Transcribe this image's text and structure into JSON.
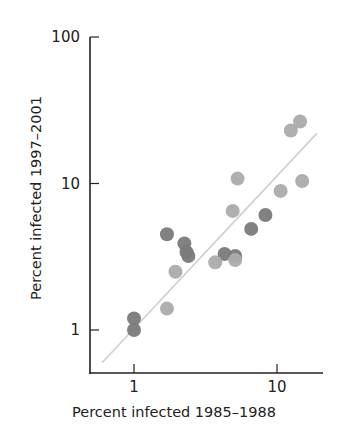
{
  "chart_data": {
    "type": "scatter",
    "title": "",
    "xlabel": "Percent infected 1985–1988",
    "ylabel": "Percent infected 1997–2001",
    "xscale": "log",
    "yscale": "log",
    "xlim": [
      0.55,
      22
    ],
    "ylim": [
      0.55,
      100
    ],
    "xticks": [
      {
        "value": 1,
        "label": "1"
      },
      {
        "value": 10,
        "label": "10"
      }
    ],
    "yticks": [
      {
        "value": 1,
        "label": "1"
      },
      {
        "value": 10,
        "label": "10"
      },
      {
        "value": 100,
        "label": "100"
      }
    ],
    "grid": false,
    "legend": null,
    "colors": {
      "dark": "#7a7a7a",
      "light": "#ababab",
      "trend": "#cfcfcf",
      "axis": "#222222"
    },
    "series": [
      {
        "name": "dark points",
        "color": "#7a7a7a",
        "points": [
          {
            "x": 1.0,
            "y": 1.0
          },
          {
            "x": 1.0,
            "y": 1.2
          },
          {
            "x": 1.7,
            "y": 4.5
          },
          {
            "x": 2.25,
            "y": 3.9
          },
          {
            "x": 2.33,
            "y": 3.4
          },
          {
            "x": 2.4,
            "y": 3.2
          },
          {
            "x": 4.3,
            "y": 3.3
          },
          {
            "x": 5.1,
            "y": 3.2
          },
          {
            "x": 6.6,
            "y": 4.9
          },
          {
            "x": 8.3,
            "y": 6.1
          }
        ]
      },
      {
        "name": "light points",
        "color": "#ababab",
        "points": [
          {
            "x": 1.7,
            "y": 1.4
          },
          {
            "x": 1.95,
            "y": 2.5
          },
          {
            "x": 3.7,
            "y": 2.9
          },
          {
            "x": 5.1,
            "y": 3.0
          },
          {
            "x": 4.9,
            "y": 6.5
          },
          {
            "x": 5.3,
            "y": 10.8
          },
          {
            "x": 10.6,
            "y": 8.9
          },
          {
            "x": 15.0,
            "y": 10.4
          },
          {
            "x": 12.5,
            "y": 23.0
          },
          {
            "x": 14.5,
            "y": 26.5
          }
        ]
      }
    ],
    "trend_line": {
      "from": {
        "x": 0.6,
        "y": 0.6
      },
      "to": {
        "x": 19.0,
        "y": 22.0
      }
    }
  }
}
